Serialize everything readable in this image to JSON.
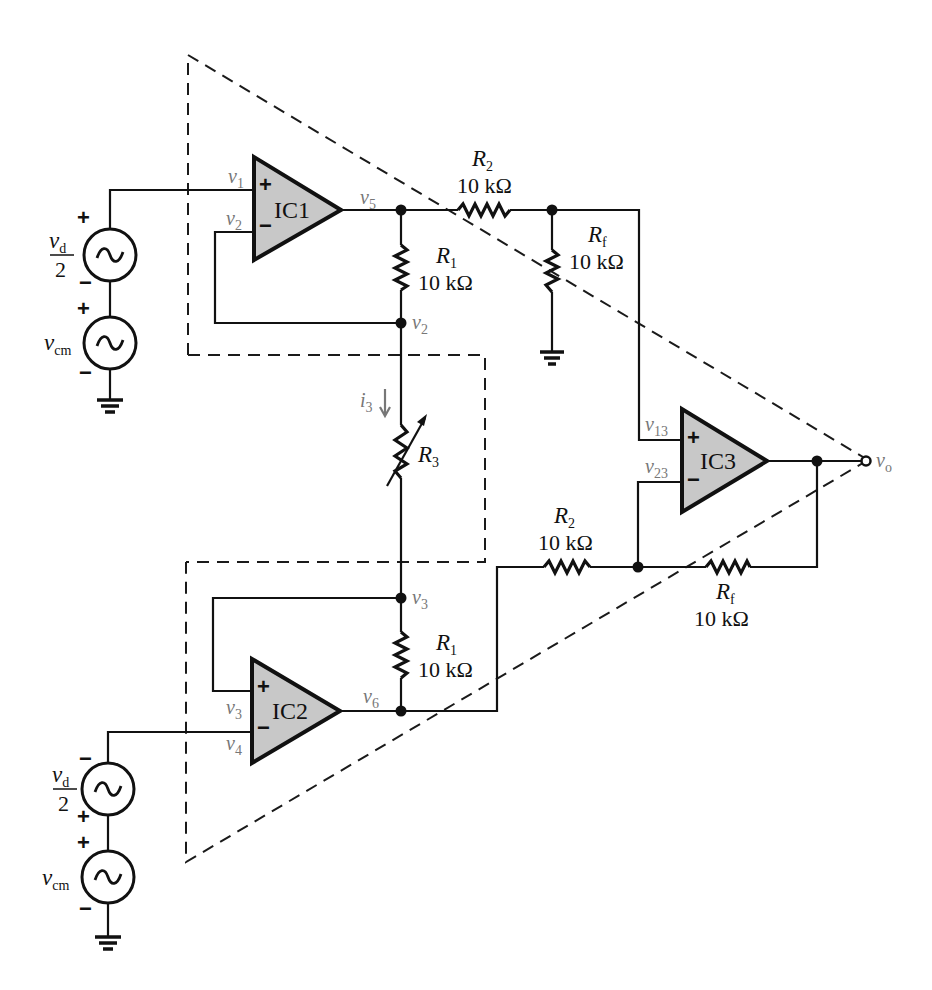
{
  "diagram": {
    "type": "instrumentation-amplifier-schematic",
    "amplifiers": [
      {
        "id": "IC1",
        "label": "IC1",
        "plus_input": "v1",
        "minus_input": "v2",
        "output": "v5"
      },
      {
        "id": "IC2",
        "label": "IC2",
        "plus_input": "v3",
        "minus_input": "v4",
        "output": "v6"
      },
      {
        "id": "IC3",
        "label": "IC3",
        "plus_input": "v13",
        "minus_input": "v23",
        "output": "vo"
      }
    ],
    "resistors": {
      "r1_top": {
        "name": "R",
        "sub": "1",
        "value": "10 kΩ"
      },
      "r1_bottom": {
        "name": "R",
        "sub": "1",
        "value": "10 kΩ"
      },
      "r2_top": {
        "name": "R",
        "sub": "2",
        "value": "10 kΩ"
      },
      "r2_bottom": {
        "name": "R",
        "sub": "2",
        "value": "10 kΩ"
      },
      "rf_top": {
        "name": "R",
        "sub": "f",
        "value": "10 kΩ"
      },
      "rf_bottom": {
        "name": "R",
        "sub": "f",
        "value": "10 kΩ"
      },
      "r3": {
        "name": "R",
        "sub": "3",
        "variable": true
      }
    },
    "current": {
      "name": "i",
      "sub": "3",
      "direction": "down"
    },
    "sources": {
      "top_diff": {
        "num": "v",
        "num_sub": "d",
        "den": "2",
        "top_sign": "+",
        "bottom_sign": "−"
      },
      "top_cm": {
        "name": "v",
        "sub": "cm",
        "top_sign": "+",
        "bottom_sign": "−"
      },
      "bottom_diff": {
        "num": "v",
        "num_sub": "d",
        "den": "2",
        "top_sign": "−",
        "bottom_sign": "+"
      },
      "bottom_cm": {
        "name": "v",
        "sub": "cm",
        "top_sign": "+",
        "bottom_sign": "−"
      }
    },
    "nodes": {
      "v1": {
        "name": "v",
        "sub": "1"
      },
      "v2": {
        "name": "v",
        "sub": "2"
      },
      "v3": {
        "name": "v",
        "sub": "3"
      },
      "v4": {
        "name": "v",
        "sub": "4"
      },
      "v5": {
        "name": "v",
        "sub": "5"
      },
      "v6": {
        "name": "v",
        "sub": "6"
      },
      "v13": {
        "name": "v",
        "sub": "13"
      },
      "v23": {
        "name": "v",
        "sub": "23"
      },
      "vo": {
        "name": "v",
        "sub": "o"
      }
    },
    "signs": {
      "plus": "+",
      "minus": "−"
    },
    "colors": {
      "opamp_fill": "#c8c8c8",
      "wire": "#111111",
      "node_label": "#777777"
    }
  }
}
